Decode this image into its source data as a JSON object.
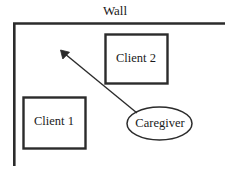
{
  "diagram": {
    "title_label": "Wall",
    "nodes": [
      {
        "id": "client1",
        "label": "Client 1",
        "shape": "rectangle"
      },
      {
        "id": "client2",
        "label": "Client 2",
        "shape": "rectangle"
      },
      {
        "id": "caregiver",
        "label": "Caregiver",
        "shape": "ellipse"
      }
    ],
    "edges": [
      {
        "id": "gaze-arrow",
        "from": "caregiver",
        "to": "open-area",
        "style": "solid-arrow"
      }
    ],
    "colors": {
      "stroke": "#2b2b2b",
      "text": "#1a1a1a",
      "background": "#ffffff"
    }
  }
}
